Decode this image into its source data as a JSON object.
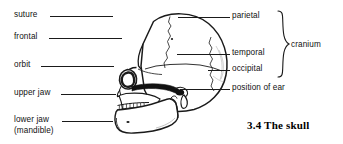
{
  "figure": {
    "caption": "3.4 The skull",
    "subject": "skull",
    "view": "lateral-left"
  },
  "labels_left": [
    {
      "id": "suture",
      "text": "suture",
      "x": 14,
      "y": 10,
      "leader": {
        "x1": 50,
        "x2": 113,
        "y": 16
      }
    },
    {
      "id": "frontal",
      "text": "frontal",
      "x": 14,
      "y": 32,
      "leader": {
        "x1": 49,
        "x2": 122,
        "y": 38
      }
    },
    {
      "id": "orbit",
      "text": "orbit",
      "x": 14,
      "y": 60,
      "leader": {
        "x1": 41,
        "x2": 114,
        "y": 66
      }
    },
    {
      "id": "upper-jaw",
      "text": "upper jaw",
      "x": 14,
      "y": 88,
      "leader": {
        "x1": 61,
        "x2": 116,
        "y": 94
      }
    },
    {
      "id": "lower-jaw",
      "text": "lower jaw\n(mandible)",
      "x": 14,
      "y": 115,
      "leader": {
        "x1": 62,
        "x2": 113,
        "y": 121
      }
    }
  ],
  "labels_right": [
    {
      "id": "parietal",
      "text": "parietal",
      "x": 232,
      "y": 11,
      "leader": {
        "x1": 178,
        "x2": 230,
        "y": 17
      }
    },
    {
      "id": "temporal",
      "text": "temporal",
      "x": 232,
      "y": 48,
      "leader": {
        "x1": 177,
        "x2": 230,
        "y": 54
      }
    },
    {
      "id": "occipital",
      "text": "occipital",
      "x": 232,
      "y": 64,
      "leader": {
        "x1": 208,
        "x2": 230,
        "y": 70
      }
    },
    {
      "id": "position-of-ear",
      "text": "position of ear",
      "x": 232,
      "y": 83,
      "leader": {
        "x1": 180,
        "x2": 230,
        "y": 89
      }
    }
  ],
  "bracket": {
    "label": "cranium",
    "label_x": 291,
    "label_y": 40,
    "x": 276,
    "y": 10,
    "height": 68
  },
  "colors": {
    "ink": "#1a1a1a",
    "text": "#111111",
    "background": "#ffffff",
    "shadow": "#808080"
  }
}
